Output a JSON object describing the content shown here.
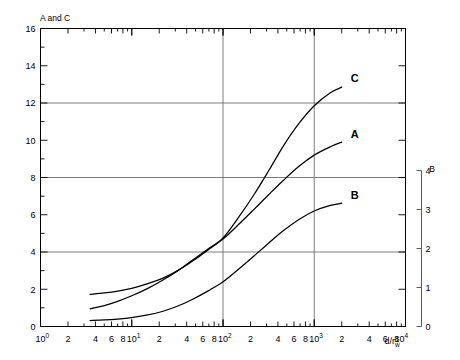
{
  "chart_data": {
    "type": "line",
    "title": "",
    "xlabel": "d/r_w",
    "ylabel_left": "A and C",
    "ylabel_right": "B",
    "xscale": "log",
    "xlim": [
      1,
      10000
    ],
    "ylim_left": [
      0,
      16
    ],
    "ylim_right": [
      0,
      4
    ],
    "grid": true,
    "grid_x_values": [
      100,
      1000
    ],
    "grid_y_values": [
      4,
      8,
      12
    ],
    "left_axis_major_ticks": [
      0,
      2,
      4,
      6,
      8,
      10,
      12,
      14,
      16
    ],
    "left_axis_minor_step": 1,
    "right_axis_major_ticks": [
      0,
      1,
      2,
      3,
      4
    ],
    "x_decade_labels": [
      "10^0",
      "10^1",
      "10^2",
      "10^3",
      "10^4"
    ],
    "x_minor_labels": [
      "2",
      "4",
      "6",
      "8"
    ],
    "legend_position": "inline-curve-labels",
    "series": [
      {
        "name": "C",
        "axis": "left",
        "label": "C",
        "x": [
          3.5,
          5,
          7,
          10,
          15,
          22,
          32,
          46,
          68,
          100,
          150,
          220,
          320,
          460,
          680,
          1000,
          1500,
          2000
        ],
        "y": [
          1.72,
          1.8,
          1.9,
          2.05,
          2.3,
          2.6,
          3.0,
          3.5,
          4.1,
          4.75,
          5.9,
          7.1,
          8.4,
          9.7,
          10.9,
          11.85,
          12.55,
          12.85
        ]
      },
      {
        "name": "A",
        "axis": "left",
        "label": "A",
        "x": [
          3.5,
          5,
          7,
          10,
          15,
          22,
          32,
          46,
          68,
          100,
          150,
          220,
          320,
          460,
          680,
          1000,
          1500,
          2000
        ],
        "y": [
          0.95,
          1.12,
          1.35,
          1.65,
          2.05,
          2.5,
          3.0,
          3.55,
          4.15,
          4.7,
          5.5,
          6.3,
          7.1,
          7.85,
          8.6,
          9.2,
          9.65,
          9.9
        ]
      },
      {
        "name": "B",
        "axis": "right",
        "label": "B",
        "x": [
          3.5,
          5,
          7,
          10,
          15,
          22,
          32,
          46,
          68,
          100,
          150,
          220,
          320,
          460,
          680,
          1000,
          1500,
          2000
        ],
        "y_left_scale": [
          0.32,
          0.35,
          0.4,
          0.48,
          0.62,
          0.82,
          1.1,
          1.45,
          1.9,
          2.4,
          3.1,
          3.8,
          4.5,
          5.15,
          5.75,
          6.2,
          6.5,
          6.62
        ],
        "y": [
          0.16,
          0.175,
          0.2,
          0.24,
          0.31,
          0.41,
          0.55,
          0.72,
          0.95,
          1.2,
          1.55,
          1.9,
          2.25,
          2.58,
          2.88,
          3.1,
          3.25,
          3.31
        ]
      }
    ]
  },
  "labels": {
    "left_axis_title": "A and C",
    "right_axis_title": "B",
    "x_axis_title_num": "d",
    "x_axis_title_den": "r",
    "x_axis_title_sub": "w"
  },
  "colors": {
    "ink": "#000000",
    "grid": "#6f6f6f",
    "background": "#ffffff"
  }
}
